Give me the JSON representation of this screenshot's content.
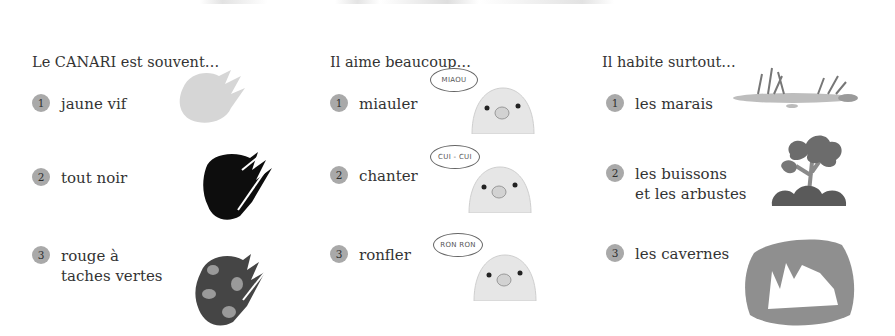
{
  "columns": [
    {
      "heading": "Le CANARI est souvent…",
      "items": [
        {
          "num": "1",
          "lines": [
            "jaune vif"
          ],
          "image": "light-gray-paint-swatch"
        },
        {
          "num": "2",
          "lines": [
            "tout noir"
          ],
          "image": "black-paint-swatch"
        },
        {
          "num": "3",
          "lines": [
            "rouge à",
            "taches vertes"
          ],
          "image": "red-with-green-spots-swatch"
        }
      ]
    },
    {
      "heading": "Il aime beaucoup…",
      "items": [
        {
          "num": "1",
          "lines": [
            "miauler"
          ],
          "bubble": "MIAOU",
          "image": "canary-head"
        },
        {
          "num": "2",
          "lines": [
            "chanter"
          ],
          "bubble": "CUI - CUI",
          "image": "canary-head"
        },
        {
          "num": "3",
          "lines": [
            "ronfler"
          ],
          "bubble": "RON RON",
          "image": "canary-head"
        }
      ]
    },
    {
      "heading": "Il habite surtout…",
      "items": [
        {
          "num": "1",
          "lines": [
            "les marais"
          ],
          "image": "marsh-illustration"
        },
        {
          "num": "2",
          "lines": [
            "les buissons",
            "et les arbustes"
          ],
          "image": "bushes-illustration"
        },
        {
          "num": "3",
          "lines": [
            "les cavernes"
          ],
          "image": "cave-illustration"
        }
      ]
    }
  ],
  "colors": {
    "badge": "#a9a9a9",
    "text": "#333333"
  }
}
